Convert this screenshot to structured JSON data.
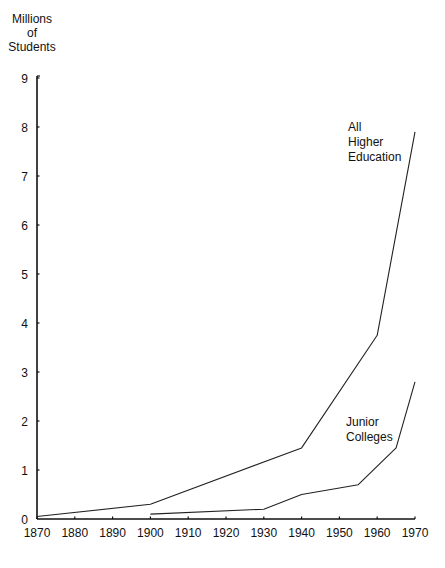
{
  "chart_data": {
    "type": "line",
    "title": "",
    "ylabel": "Millions of Students",
    "ylabel_lines": [
      "Millions",
      "of",
      "Students"
    ],
    "xlabel": "",
    "xlim": [
      1870,
      1970
    ],
    "ylim": [
      0,
      9
    ],
    "xticks": [
      1870,
      1880,
      1890,
      1900,
      1910,
      1920,
      1930,
      1940,
      1950,
      1960,
      1970
    ],
    "yticks": [
      0,
      1,
      2,
      3,
      4,
      5,
      6,
      7,
      8,
      9
    ],
    "grid": false,
    "legend": "inline labels",
    "series": [
      {
        "name": "All Higher Education",
        "label_lines": [
          "All",
          "Higher",
          "Education"
        ],
        "x": [
          1870,
          1900,
          1940,
          1960,
          1970
        ],
        "values": [
          0.05,
          0.3,
          1.45,
          3.75,
          7.9
        ]
      },
      {
        "name": "Junior Colleges",
        "label_lines": [
          "Junior",
          "Colleges"
        ],
        "x": [
          1900,
          1930,
          1940,
          1955,
          1965,
          1970
        ],
        "values": [
          0.1,
          0.2,
          0.5,
          0.7,
          1.45,
          2.8
        ]
      }
    ]
  }
}
